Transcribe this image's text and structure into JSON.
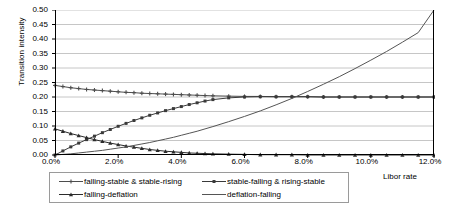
{
  "chart_data": {
    "type": "line",
    "title": "",
    "xlabel": "Libor rate",
    "ylabel": "Transition intensity",
    "xlim": [
      0,
      12
    ],
    "ylim": [
      0,
      0.5
    ],
    "grid": true,
    "legend_position": "bottom",
    "xticks": [
      "0.0%",
      "2.0%",
      "4.0%",
      "6.0%",
      "8.0%",
      "10.0%",
      "12.0%"
    ],
    "xtick_values": [
      0,
      2,
      4,
      6,
      8,
      10,
      12
    ],
    "yticks": [
      "0.00",
      "0.05",
      "0.10",
      "0.15",
      "0.20",
      "0.25",
      "0.30",
      "0.35",
      "0.40",
      "0.45",
      "0.50"
    ],
    "ytick_values": [
      0,
      0.05,
      0.1,
      0.15,
      0.2,
      0.25,
      0.3,
      0.35,
      0.4,
      0.45,
      0.5
    ],
    "x": [
      0,
      0.25,
      0.5,
      0.75,
      1,
      1.25,
      1.5,
      1.75,
      2,
      2.25,
      2.5,
      2.75,
      3,
      3.25,
      3.5,
      3.75,
      4,
      4.25,
      4.5,
      4.75,
      5,
      5.5,
      6,
      6.5,
      7,
      7.5,
      8,
      8.5,
      9,
      9.5,
      10,
      10.5,
      11,
      11.5,
      12
    ],
    "series": [
      {
        "name": "falling-stable & stable-rising",
        "marker": "cross",
        "color": "#4d4d4d",
        "values": [
          0.24,
          0.236,
          0.232,
          0.229,
          0.226,
          0.224,
          0.222,
          0.22,
          0.218,
          0.216,
          0.215,
          0.213,
          0.212,
          0.211,
          0.21,
          0.209,
          0.208,
          0.207,
          0.206,
          0.205,
          0.204,
          0.203,
          0.202,
          0.202,
          0.201,
          0.201,
          0.201,
          0.2,
          0.2,
          0.2,
          0.2,
          0.2,
          0.2,
          0.2,
          0.2
        ]
      },
      {
        "name": "stable-falling & rising-stable",
        "marker": "square",
        "color": "#3a3a3a",
        "values": [
          0.0,
          0.014,
          0.028,
          0.041,
          0.053,
          0.065,
          0.077,
          0.088,
          0.099,
          0.109,
          0.119,
          0.128,
          0.137,
          0.145,
          0.153,
          0.16,
          0.167,
          0.174,
          0.18,
          0.186,
          0.191,
          0.197,
          0.2,
          0.201,
          0.201,
          0.201,
          0.201,
          0.2,
          0.2,
          0.2,
          0.2,
          0.2,
          0.2,
          0.2,
          0.2
        ]
      },
      {
        "name": "falling-deflation",
        "marker": "triangle",
        "color": "#2b2b2b",
        "values": [
          0.09,
          0.082,
          0.074,
          0.067,
          0.06,
          0.053,
          0.047,
          0.041,
          0.036,
          0.031,
          0.027,
          0.023,
          0.019,
          0.016,
          0.013,
          0.011,
          0.009,
          0.007,
          0.006,
          0.005,
          0.004,
          0.003,
          0.002,
          0.001,
          0.001,
          0.001,
          0.0,
          0.0,
          0.0,
          0.0,
          0.0,
          0.0,
          0.0,
          0.0,
          0.0
        ]
      },
      {
        "name": "deflation-falling",
        "marker": "none",
        "color": "#555555",
        "values": [
          0.0,
          0.002,
          0.004,
          0.007,
          0.01,
          0.013,
          0.016,
          0.02,
          0.024,
          0.028,
          0.033,
          0.038,
          0.043,
          0.049,
          0.055,
          0.061,
          0.068,
          0.075,
          0.082,
          0.09,
          0.098,
          0.115,
          0.133,
          0.152,
          0.173,
          0.195,
          0.219,
          0.244,
          0.27,
          0.298,
          0.327,
          0.357,
          0.389,
          0.422,
          0.5
        ]
      }
    ],
    "legend": [
      {
        "label": "falling-stable & stable-rising",
        "marker": "cross"
      },
      {
        "label": "stable-falling & rising-stable",
        "marker": "square"
      },
      {
        "label": "falling-deflation",
        "marker": "triangle"
      },
      {
        "label": "deflation-falling",
        "marker": "none"
      }
    ]
  },
  "colors": {
    "axis": "#000000",
    "grid": "#b8b8b8",
    "plot_bg": "#ffffff",
    "legend_border": "#9a9a9a"
  }
}
